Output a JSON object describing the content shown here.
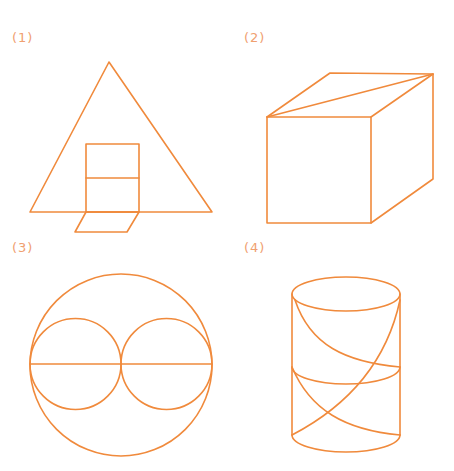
{
  "colors": {
    "stroke": "#f08a3c",
    "label": "#f0a070",
    "background": "#ffffff"
  },
  "figures": [
    {
      "id": 1,
      "label": "(1)",
      "shape": "triangle with rectangle split in two and parallelogram below"
    },
    {
      "id": 2,
      "label": "(2)",
      "shape": "cube with top-face diagonal"
    },
    {
      "id": 3,
      "label": "(3)",
      "shape": "large circle with two inner tangent circles and horizontal diameter"
    },
    {
      "id": 4,
      "label": "(4)",
      "shape": "cylinder with middle ellipse and two crossing helical curves"
    }
  ]
}
